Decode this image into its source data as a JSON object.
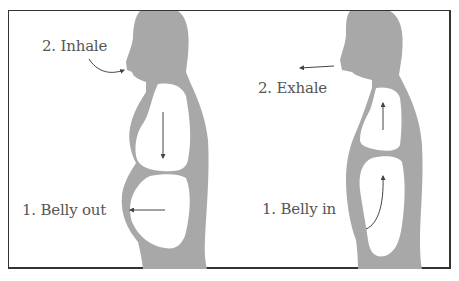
{
  "diagram": {
    "colors": {
      "body": "#a8a8a8",
      "arrow": "#444444",
      "text": "#555555",
      "border": "#333333"
    },
    "left_panel": {
      "title": "Inhale breathing",
      "labels": {
        "step2": "2. Inhale",
        "step1": "1. Belly out"
      }
    },
    "right_panel": {
      "title": "Exhale breathing",
      "labels": {
        "step2": "2. Exhale",
        "step1": "1. Belly in"
      }
    }
  }
}
